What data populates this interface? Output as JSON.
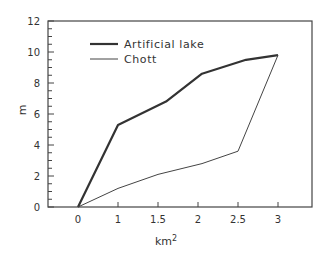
{
  "chart_data": {
    "type": "line",
    "title": "",
    "xlabel": "km2",
    "xlabel_base": "km",
    "xlabel_sup": "2",
    "ylabel": "m",
    "x_tick_labels": [
      "0",
      "1",
      "1.5",
      "2",
      "2.5",
      "3"
    ],
    "y_tick_labels": [
      "0",
      "2",
      "4",
      "6",
      "8",
      "10",
      "12"
    ],
    "ylim": [
      0,
      12
    ],
    "y_minor_tick_step": 0.5,
    "grid": false,
    "legend_position": "upper left (inside plot)",
    "note": "x-axis ticks are evenly spaced despite labels 0,1,1.5,2,2.5,3; x values below are in tick-index units mapped to those labels",
    "series": [
      {
        "name": "Artificial lake",
        "line_weight": "thick",
        "x": [
          0,
          1,
          1.6,
          2.05,
          2.6,
          3.0
        ],
        "y": [
          0,
          5.3,
          6.8,
          8.6,
          9.5,
          9.8
        ]
      },
      {
        "name": "Chott",
        "line_weight": "thin",
        "x": [
          0,
          1,
          1.5,
          2.05,
          2.5,
          3.0
        ],
        "y": [
          0,
          1.2,
          2.1,
          2.8,
          3.6,
          9.8
        ]
      }
    ]
  },
  "legend": {
    "items": [
      {
        "label": "Artificial lake"
      },
      {
        "label": "Chott"
      }
    ]
  },
  "axes": {
    "x_label_base": "km",
    "x_label_sup": "2",
    "y_label": "m"
  }
}
